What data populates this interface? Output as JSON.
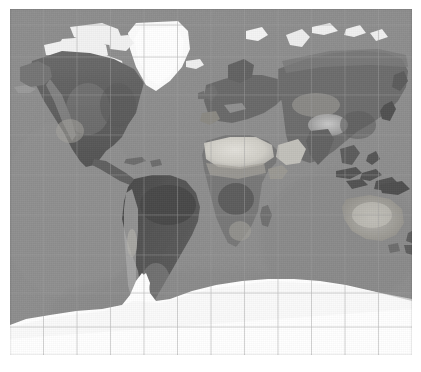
{
  "figure": {
    "kind": "world-map-image",
    "projection": "Mercator",
    "rendering": "grayscale shaded relief / satellite composite",
    "frame": {
      "x": 10,
      "y": 9,
      "width": 402,
      "height": 346
    },
    "page": {
      "width": 421,
      "height": 372,
      "background": "#ffffff"
    }
  },
  "colors": {
    "page_background": "#ffffff",
    "ocean": "#8d8d8d",
    "ocean_light": "#949494",
    "ocean_dark": "#858585",
    "land_dark": "#4e4e4e",
    "land_mid": "#6e6e6e",
    "land_light": "#b9b9b9",
    "desert": "#d6d4cf",
    "ice": "#fdfdfd",
    "graticule": "#9d9d9d"
  },
  "graticule": {
    "visible": true,
    "meridian_interval_deg": 30,
    "parallel_interval_deg": 20,
    "line_color": "#9d9d9d",
    "line_width": 0.6,
    "meridian_labels": [
      "180W",
      "150W",
      "120W",
      "90W",
      "60W",
      "30W",
      "0",
      "30E",
      "60E",
      "90E",
      "120E",
      "150E",
      "180E"
    ],
    "parallel_labels": [
      "80N",
      "60N",
      "40N",
      "20N",
      "0",
      "20S",
      "40S",
      "60S",
      "80S"
    ],
    "labels_visible": false
  },
  "regions": [
    {
      "name": "greenland",
      "label": "Greenland",
      "tone": "ice"
    },
    {
      "name": "canadian-arctic",
      "label": "Canadian Arctic Archipelago",
      "tone": "ice"
    },
    {
      "name": "north-america",
      "label": "North America",
      "tone": "land_mid"
    },
    {
      "name": "south-america",
      "label": "South America",
      "tone": "land_dark"
    },
    {
      "name": "africa",
      "label": "Africa",
      "tone": "land_mid"
    },
    {
      "name": "sahara",
      "label": "Sahara Desert",
      "tone": "desert"
    },
    {
      "name": "europe",
      "label": "Europe",
      "tone": "land_mid"
    },
    {
      "name": "asia",
      "label": "Asia",
      "tone": "land_mid"
    },
    {
      "name": "tibet-himalaya",
      "label": "Tibetan Plateau",
      "tone": "land_light"
    },
    {
      "name": "arabian-peninsula",
      "label": "Arabian Peninsula",
      "tone": "desert"
    },
    {
      "name": "australia",
      "label": "Australia",
      "tone": "land_light"
    },
    {
      "name": "new-zealand",
      "label": "New Zealand",
      "tone": "land_mid"
    },
    {
      "name": "antarctica",
      "label": "Antarctica",
      "tone": "ice"
    },
    {
      "name": "iceland",
      "label": "Iceland",
      "tone": "ice"
    },
    {
      "name": "svalbard",
      "label": "Svalbard",
      "tone": "ice"
    },
    {
      "name": "madagascar",
      "label": "Madagascar",
      "tone": "land_mid"
    },
    {
      "name": "japan",
      "label": "Japan",
      "tone": "land_dark"
    },
    {
      "name": "indonesia",
      "label": "Indonesian Archipelago",
      "tone": "land_dark"
    },
    {
      "name": "british-isles",
      "label": "British Isles",
      "tone": "land_mid"
    }
  ]
}
